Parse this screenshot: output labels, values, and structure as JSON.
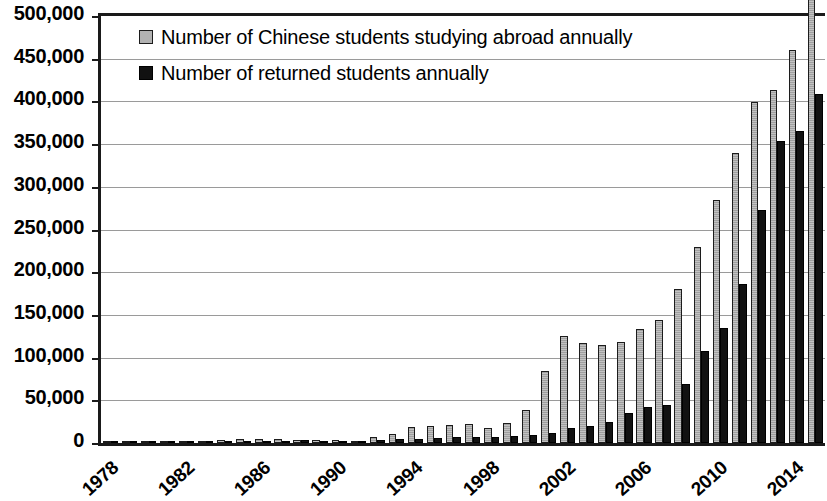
{
  "chart_data": {
    "type": "bar",
    "title": "",
    "subtitle": "",
    "xlabel": "",
    "ylabel": "",
    "ylim": [
      0,
      500000
    ],
    "ytick_labels": [
      "0",
      "50,000",
      "100,000",
      "150,000",
      "200,000",
      "250,000",
      "300,000",
      "350,000",
      "400,000",
      "450,000",
      "500,000"
    ],
    "ytick_values": [
      0,
      50000,
      100000,
      150000,
      200000,
      250000,
      300000,
      350000,
      400000,
      450000,
      500000
    ],
    "grid": true,
    "grid_axis": "y",
    "legend_position": "top-left",
    "categories": [
      "1978",
      "1979",
      "1980",
      "1981",
      "1982",
      "1983",
      "1984",
      "1985",
      "1986",
      "1987",
      "1988",
      "1989",
      "1990",
      "1991",
      "1992",
      "1993",
      "1994",
      "1995",
      "1996",
      "1997",
      "1998",
      "1999",
      "2000",
      "2001",
      "2002",
      "2003",
      "2004",
      "2005",
      "2006",
      "2007",
      "2008",
      "2009",
      "2010",
      "2011",
      "2012",
      "2013",
      "2014",
      "2015"
    ],
    "xtick_labels": [
      "1978",
      "1982",
      "1986",
      "1990",
      "1994",
      "1998",
      "2002",
      "2006",
      "2010",
      "2014"
    ],
    "series": [
      {
        "name": "Number of Chinese students studying abroad annually",
        "color": "#a8a8a8",
        "values": [
          860,
          1750,
          2124,
          2922,
          2326,
          2633,
          3073,
          4888,
          4676,
          4703,
          3786,
          3329,
          2950,
          2900,
          6540,
          10742,
          19071,
          20381,
          20905,
          22410,
          17622,
          23749,
          38989,
          83973,
          125179,
          117307,
          114682,
          118515,
          134000,
          144000,
          179800,
          229300,
          284700,
          339700,
          399600,
          413900,
          459800,
          523700
        ],
        "display_values": [
          900,
          1800,
          2100,
          2900,
          2300,
          2600,
          3100,
          4900,
          4700,
          4700,
          3800,
          3300,
          3000,
          2900,
          6500,
          10700,
          19100,
          20400,
          20900,
          22400,
          17600,
          23700,
          39000,
          84000,
          125200,
          117300,
          114700,
          118500,
          134000,
          144000,
          179800,
          229300,
          284700,
          339700,
          399600,
          413900,
          459800,
          523700
        ]
      },
      {
        "name": "Number of returned students annually",
        "color": "#121212",
        "values": [
          248,
          231,
          162,
          1143,
          2116,
          2920,
          2920,
          1424,
          1388,
          1605,
          3000,
          1753,
          1593,
          2069,
          3611,
          5128,
          4230,
          5750,
          6570,
          7130,
          7379,
          7748,
          9121,
          12243,
          17945,
          20152,
          24726,
          34987,
          42000,
          44000,
          69300,
          108300,
          134800,
          186200,
          272900,
          353500,
          364800,
          409100
        ],
        "display_values": [
          250,
          230,
          160,
          1100,
          2100,
          2900,
          2900,
          1400,
          1400,
          1600,
          3000,
          1800,
          1600,
          2100,
          3600,
          5100,
          4200,
          5800,
          6600,
          7100,
          7400,
          7700,
          9100,
          12200,
          17900,
          20200,
          24700,
          35000,
          42000,
          44000,
          69300,
          108300,
          134800,
          186200,
          272900,
          353500,
          364800,
          409100
        ]
      }
    ]
  },
  "legend": {
    "items": [
      {
        "label": "Number of Chinese students studying abroad annually",
        "swatch": "gray"
      },
      {
        "label": "Number of returned students annually",
        "swatch": "black"
      }
    ]
  }
}
